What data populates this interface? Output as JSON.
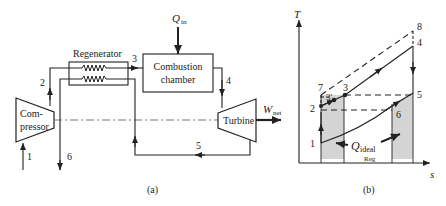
{
  "figure_a": {
    "caption": "(a)",
    "components": {
      "compressor": {
        "label_line1": "Com-",
        "label_line2": "pressor"
      },
      "regenerator": {
        "label": "Regenerator"
      },
      "combustion_chamber": {
        "label_line1": "Combustion",
        "label_line2": "chamber"
      },
      "turbine": {
        "label": "Turbine"
      }
    },
    "heat_input": {
      "symbol": "Q",
      "subscript": "in"
    },
    "work_output": {
      "symbol": "W",
      "subscript": "net"
    },
    "state_labels": [
      "1",
      "2",
      "3",
      "4",
      "5",
      "6"
    ]
  },
  "figure_b": {
    "caption": "(b)",
    "y_axis_label": "T",
    "x_axis_label": "s",
    "state_labels": [
      "1",
      "2",
      "3",
      "3′",
      "4",
      "5",
      "6",
      "7",
      "8"
    ],
    "annotation": {
      "symbol": "Q",
      "subscript": "ideal",
      "sub_subscript": "Reg"
    },
    "colors": {
      "shade": "#d0d0d0",
      "line": "#222222"
    }
  }
}
